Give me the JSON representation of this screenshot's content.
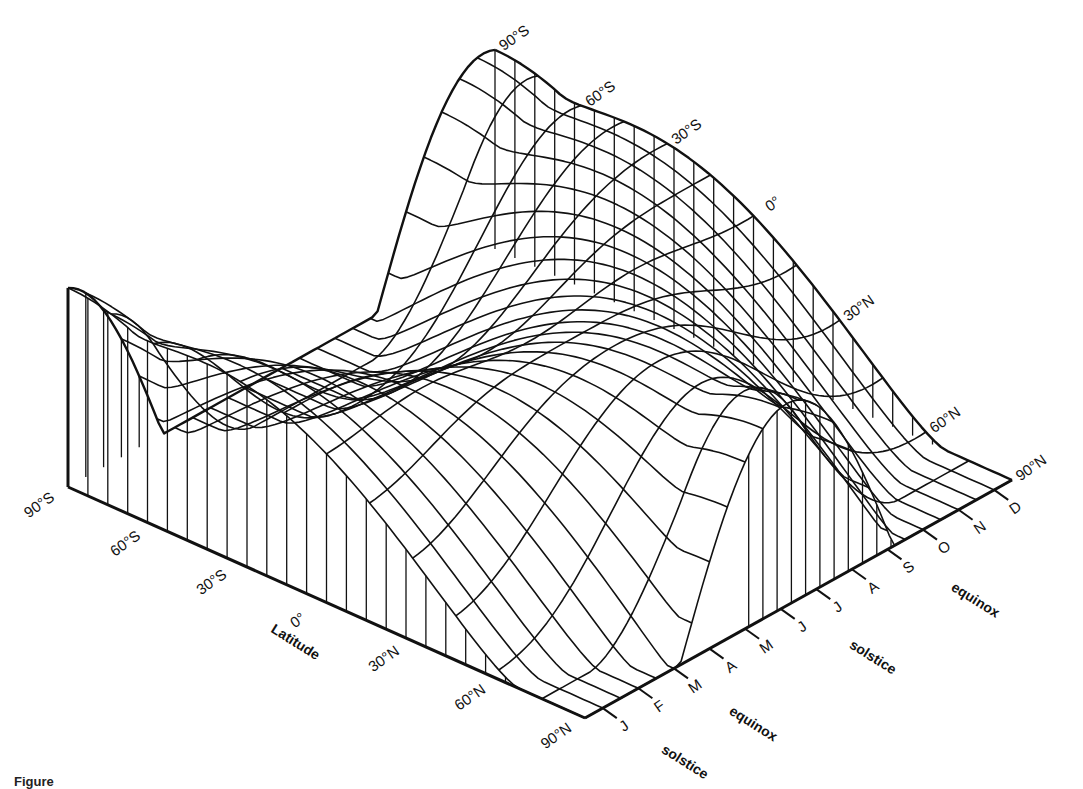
{
  "figure": {
    "caption_fragment": "Figure"
  },
  "chart_data": {
    "type": "surface3d",
    "title": "",
    "x_axis": {
      "label": "Latitude",
      "ticks": [
        "90°S",
        "60°S",
        "30°S",
        "0°",
        "30°N",
        "60°N",
        "90°N"
      ]
    },
    "y_axis": {
      "label": "Month",
      "ticks": [
        "J",
        "F",
        "M",
        "A",
        "M",
        "J",
        "J",
        "A",
        "S",
        "O",
        "N",
        "D"
      ],
      "annotations": [
        {
          "text": "solstice",
          "near": "J (Jan)"
        },
        {
          "text": "equinox",
          "near": "M (Mar)"
        },
        {
          "text": "solstice",
          "near": "J (Jun/Jul)"
        },
        {
          "text": "equinox",
          "near": "S/O (Sep/Oct)"
        }
      ]
    },
    "back_edge_labels": [
      "90°S",
      "60°S",
      "30°S",
      "0°",
      "30°N",
      "60°N",
      "90°N"
    ],
    "z_range": [
      0,
      1
    ],
    "grid": true,
    "latitudes": [
      -90,
      -75,
      -60,
      -45,
      -30,
      -15,
      0,
      15,
      30,
      45,
      60,
      75,
      90
    ],
    "months": [
      0,
      1,
      2,
      3,
      4,
      5,
      6,
      7,
      8,
      9,
      10,
      11
    ]
  },
  "colors": {
    "line": "#111111",
    "background": "#ffffff"
  },
  "projection": {
    "origin": [
      68,
      487
    ],
    "lat_vector": [
      517,
      231
    ],
    "month_vector": [
      427,
      -238
    ],
    "height_scale": 210
  }
}
